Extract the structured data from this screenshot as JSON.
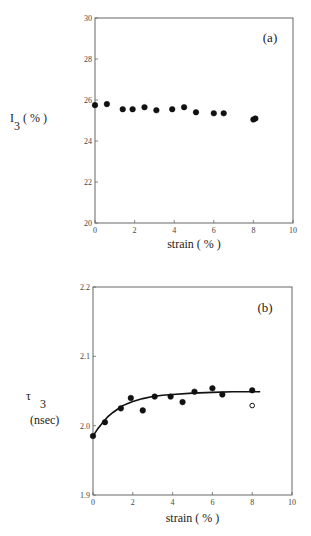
{
  "chart_data": [
    {
      "type": "scatter",
      "panel_label": "(a)",
      "title": "",
      "xlabel": "strain ( % )",
      "ylabel_main": "I",
      "ylabel_sub": "3",
      "ylabel_unit": "( % )",
      "xlim": [
        0,
        10
      ],
      "ylim": [
        20,
        30
      ],
      "xticks": [
        0,
        2,
        4,
        6,
        8,
        10
      ],
      "yticks": [
        20,
        22,
        24,
        26,
        28,
        30
      ],
      "grid": false,
      "series": [
        {
          "name": "I3",
          "marker": "filled-circle",
          "x": [
            0.0,
            0.6,
            1.4,
            1.9,
            2.5,
            3.1,
            3.9,
            4.5,
            5.1,
            6.0,
            6.5,
            8.0,
            8.1
          ],
          "y": [
            25.75,
            25.8,
            25.55,
            25.55,
            25.65,
            25.5,
            25.55,
            25.65,
            25.4,
            25.35,
            25.35,
            25.05,
            25.1
          ]
        }
      ]
    },
    {
      "type": "scatter",
      "panel_label": "(b)",
      "title": "",
      "xlabel": "strain ( % )",
      "ylabel_main": "τ",
      "ylabel_sub": "3",
      "ylabel_unit": "(nsec)",
      "xlim": [
        0,
        10
      ],
      "ylim": [
        1.9,
        2.2
      ],
      "xticks": [
        0,
        2,
        4,
        6,
        8,
        10
      ],
      "yticks": [
        1.9,
        2.0,
        2.1,
        2.2
      ],
      "ytick_labels": [
        "1.9",
        "2.0",
        "2.1",
        "2.2"
      ],
      "grid": false,
      "series": [
        {
          "name": "tau3",
          "marker": "filled-circle",
          "x": [
            0.0,
            0.6,
            1.4,
            1.9,
            2.5,
            3.1,
            3.9,
            4.5,
            5.1,
            6.0,
            6.5,
            8.0
          ],
          "y": [
            1.985,
            2.005,
            2.025,
            2.04,
            2.022,
            2.042,
            2.042,
            2.034,
            2.049,
            2.054,
            2.045,
            2.051
          ]
        },
        {
          "name": "tau3-open",
          "marker": "open-circle",
          "x": [
            8.0
          ],
          "y": [
            2.029
          ]
        },
        {
          "name": "fit",
          "type": "line",
          "x": [
            0,
            0.25,
            0.5,
            0.75,
            1.0,
            1.25,
            1.5,
            1.75,
            2.0,
            2.5,
            3.0,
            3.5,
            4.0,
            5.0,
            6.0,
            7.0,
            8.0,
            8.4
          ],
          "y": [
            1.985,
            1.996,
            2.005,
            2.013,
            2.019,
            2.024,
            2.029,
            2.032,
            2.035,
            2.039,
            2.042,
            2.044,
            2.045,
            2.047,
            2.048,
            2.049,
            2.049,
            2.049
          ]
        }
      ]
    }
  ]
}
